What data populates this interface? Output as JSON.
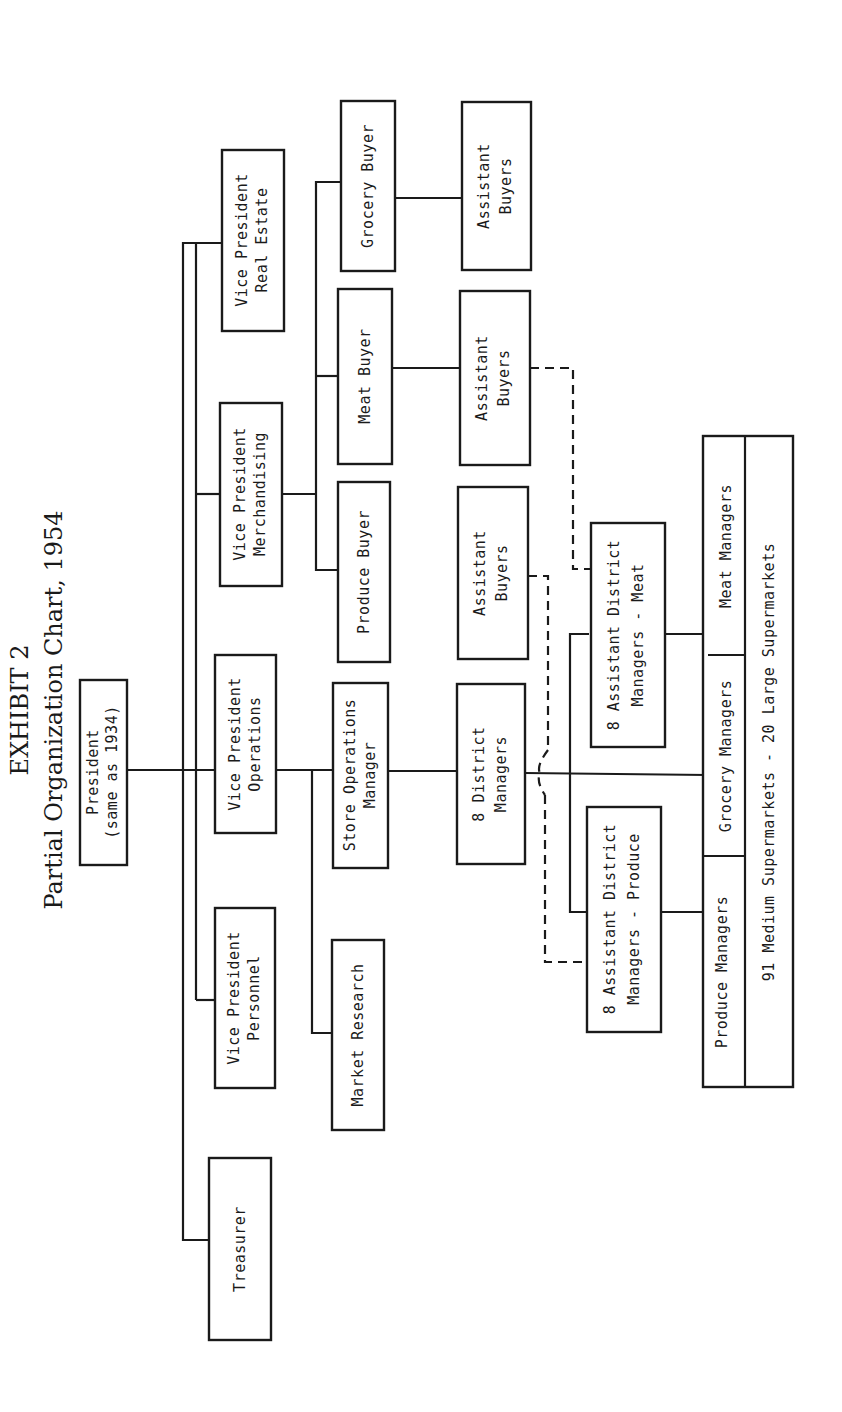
{
  "title": {
    "exhibit": "EXHIBIT 2",
    "subtitle": "Partial Organization Chart, 1954"
  },
  "nodes": {
    "president": {
      "line1": "President",
      "line2": "(same as 1934)"
    },
    "treasurer": {
      "line1": "Treasurer"
    },
    "vp_personnel": {
      "line1": "Vice President",
      "line2": "Personnel"
    },
    "vp_operations": {
      "line1": "Vice President",
      "line2": "Operations"
    },
    "vp_merchandising": {
      "line1": "Vice President",
      "line2": "Merchandising"
    },
    "vp_real_estate": {
      "line1": "Vice President",
      "line2": "Real Estate"
    },
    "market_research": {
      "line1": "Market Research"
    },
    "store_operations_manager": {
      "line1": "Store Operations",
      "line2": "Manager"
    },
    "produce_buyer": {
      "line1": "Produce Buyer"
    },
    "meat_buyer": {
      "line1": "Meat  Buyer"
    },
    "grocery_buyer": {
      "line1": "Grocery Buyer"
    },
    "district_managers": {
      "line1": "8 District",
      "line2": "Managers"
    },
    "assistant_buyers_produce": {
      "line1": "Assistant",
      "line2": "Buyers"
    },
    "assistant_buyers_meat": {
      "line1": "Assistant",
      "line2": "Buyers"
    },
    "assistant_buyers_grocery": {
      "line1": "Assistant",
      "line2": "Buyers"
    },
    "asst_district_produce": {
      "line1": "8 Assistant District",
      "line2": "Managers - Produce"
    },
    "asst_district_meat": {
      "line1": "8 Assistant District",
      "line2": "Managers - Meat"
    },
    "produce_managers": {
      "line1": "Produce Managers"
    },
    "grocery_managers": {
      "line1": "Grocery Managers"
    },
    "meat_managers": {
      "line1": "Meat Managers"
    },
    "supermarkets": {
      "line1": "91 Medium Supermarkets - 20 Large Supermarkets"
    }
  },
  "colors": {
    "ink": "#1a1a1a",
    "paper": "#ffffff"
  }
}
